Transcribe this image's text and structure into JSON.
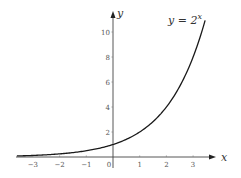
{
  "chart_data": {
    "type": "line",
    "title": "",
    "function": "y = 2^x",
    "annotation": {
      "text": "y = 2",
      "superscript": "x"
    },
    "xlabel": "x",
    "ylabel": "y",
    "xlim": [
      -3.6,
      3.8
    ],
    "ylim": [
      -0.9,
      11.6
    ],
    "x_ticks": [
      -3,
      -2,
      -1,
      0,
      1,
      2,
      3
    ],
    "x_tick_labels": [
      "−3",
      "−2",
      "−1",
      "0",
      "1",
      "2",
      "3"
    ],
    "y_ticks": [
      2,
      4,
      6,
      8,
      10
    ],
    "y_tick_labels": [
      "2",
      "4",
      "6",
      "8",
      "10"
    ],
    "grid": false,
    "legend": null,
    "series": [
      {
        "name": "y = 2^x",
        "x": [
          -3.6,
          -3,
          -2.5,
          -2,
          -1.5,
          -1,
          -0.5,
          0,
          0.5,
          1,
          1.5,
          2,
          2.5,
          3,
          3.45
        ],
        "values": [
          0.08,
          0.125,
          0.18,
          0.25,
          0.35,
          0.5,
          0.71,
          1,
          1.41,
          2,
          2.83,
          4,
          5.66,
          8,
          10.93
        ]
      }
    ],
    "colors": {
      "curve": "#1a1a1a",
      "axes": "#333333",
      "ticks": "#888888"
    }
  }
}
